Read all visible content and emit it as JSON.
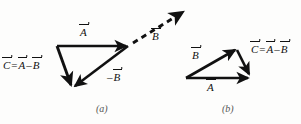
{
  "figure": {
    "background_color": "#fdfdfc",
    "ink_color": "#111111",
    "panels": [
      {
        "id": "a",
        "caption": "(a)",
        "labels": {
          "resultant": {
            "lhs": "C",
            "eq": "=",
            "first": "A",
            "op": "–",
            "second": "B"
          },
          "vector_a": "A",
          "negative_b": {
            "sign": "–",
            "name": "B"
          },
          "dashed_b": "B"
        },
        "vectors": [
          {
            "name": "A",
            "style": "solid",
            "from": [
              57,
              46
            ],
            "to": [
              128,
              46
            ]
          },
          {
            "name": "-B",
            "style": "solid",
            "from": [
              128,
              46
            ],
            "to": [
              73,
              87
            ]
          },
          {
            "name": "C",
            "style": "solid",
            "from": [
              57,
              46
            ],
            "to": [
              72,
              88
            ]
          },
          {
            "name": "B",
            "style": "dashed",
            "from": [
              132,
              44
            ],
            "to": [
              186,
              10
            ]
          }
        ]
      },
      {
        "id": "b",
        "caption": "(b)",
        "labels": {
          "vector_b": "B",
          "vector_a": "A",
          "resultant": {
            "lhs": "C",
            "eq": "=",
            "first": "A",
            "op": "–",
            "second": "B"
          }
        },
        "vectors": [
          {
            "name": "B",
            "style": "solid",
            "from": [
              186,
              78
            ],
            "to": [
              237,
              49
            ]
          },
          {
            "name": "C",
            "style": "solid",
            "from": [
              237,
              49
            ],
            "to": [
              250,
              76
            ]
          },
          {
            "name": "A",
            "style": "solid",
            "from": [
              186,
              78
            ],
            "to": [
              250,
              78
            ]
          }
        ]
      }
    ]
  }
}
